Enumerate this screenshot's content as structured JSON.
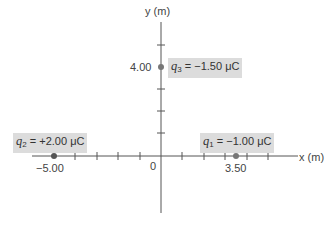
{
  "axes": {
    "x_label": "x (m)",
    "y_label": "y (m)",
    "origin_label": "0",
    "x_tick_labels": [
      {
        "value": -5.0,
        "text": "−5.00"
      },
      {
        "value": 3.5,
        "text": "3.50"
      }
    ],
    "y_tick_labels": [
      {
        "value": 4.0,
        "text": "4.00"
      }
    ],
    "colors": {
      "axis": "#555555",
      "label_box": "#dcdcdc",
      "point": "#666666"
    }
  },
  "charges": [
    {
      "name": "q1",
      "symbol": "q",
      "subscript": "1",
      "value_text": "= −1.00 μC",
      "x": 3.5,
      "y": 0
    },
    {
      "name": "q2",
      "symbol": "q",
      "subscript": "2",
      "value_text": "= +2.00 μC",
      "x": -5.0,
      "y": 0
    },
    {
      "name": "q3",
      "symbol": "q",
      "subscript": "3",
      "value_text": "= −1.50 μC",
      "x": 0,
      "y": 4.0
    }
  ]
}
